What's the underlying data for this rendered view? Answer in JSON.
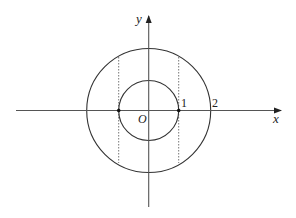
{
  "diagram": {
    "type": "coordinate-geometry",
    "axes": {
      "x_label": "x",
      "y_label": "y",
      "origin_label": "O"
    },
    "tick_labels": [
      "1",
      "2"
    ],
    "circles": [
      {
        "name": "inner-circle",
        "radius_units": 1
      },
      {
        "name": "outer-circle",
        "radius_units": 2
      }
    ],
    "points": [
      {
        "name": "point-neg-1",
        "x": -1,
        "y": 0
      },
      {
        "name": "point-1",
        "x": 1,
        "y": 0
      }
    ],
    "dashed_lines": [
      {
        "name": "dashed-line-x-neg-1",
        "x": -1
      },
      {
        "name": "dashed-line-x-1",
        "x": 1
      }
    ],
    "colors": {
      "stroke": "#333333",
      "axis": "#555555",
      "dashed": "#777777"
    }
  }
}
